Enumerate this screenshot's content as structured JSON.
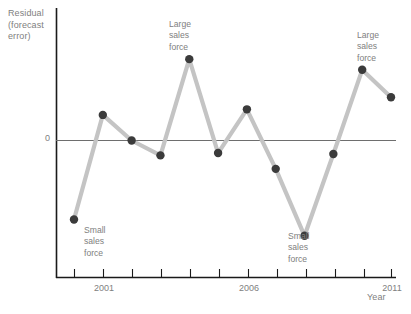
{
  "chart_data": {
    "type": "line",
    "title": "",
    "subtitle": "",
    "xlabel": "Year",
    "ylabel": "Residual\n(forecast\nerror)",
    "ylabel_lines": [
      "Residual",
      "(forecast",
      "error)"
    ],
    "xlim": [
      1999.5,
      2011.5
    ],
    "ylim": [
      -2.3,
      2.1
    ],
    "grid": false,
    "legend": null,
    "zero_line": true,
    "zero_tick_label": "0",
    "x_tick_labels": [
      "2001",
      "2006",
      "2011"
    ],
    "x_tick_label_values": [
      2001,
      2006,
      2011
    ],
    "x_minor_ticks": [
      2000,
      2001,
      2002,
      2003,
      2004,
      2005,
      2006,
      2007,
      2008,
      2009,
      2010,
      2011
    ],
    "x": [
      2000,
      2001,
      2002,
      2003,
      2004,
      2005,
      2006,
      2007,
      2008,
      2009,
      2010,
      2011
    ],
    "values": [
      -1.7,
      0.55,
      0.0,
      -0.32,
      1.75,
      -0.27,
      0.67,
      -0.61,
      -2.05,
      -0.29,
      1.52,
      0.93
    ],
    "series": [
      {
        "name": "Residual (forecast error)",
        "values": [
          -1.7,
          0.55,
          0.0,
          -0.32,
          1.75,
          -0.27,
          0.67,
          -0.61,
          -2.05,
          -0.29,
          1.52,
          0.93
        ],
        "line_color": "#c4c4c4",
        "marker_color": "#3b3b3b"
      }
    ],
    "annotations": [
      {
        "id": "small-1",
        "text": "Small\nsales\nforce",
        "point_index": 0
      },
      {
        "id": "large-1",
        "text": "Large\nsales\nforce",
        "point_index": 4
      },
      {
        "id": "small-2",
        "text": "Small\nsales\nforce",
        "point_index": 8
      },
      {
        "id": "large-2",
        "text": "Large\nsales\nforce",
        "point_index": 10
      }
    ],
    "colors": {
      "line": "#c4c4c4",
      "marker": "#3b3b3b",
      "axis": "#1a1a1a",
      "zero_line": "#6e6e6e",
      "text": "#808080",
      "background": "#ffffff"
    }
  },
  "annotations": {
    "small_1": "Small\nsales\nforce",
    "large_1": "Large\nsales\nforce",
    "small_2": "Small\nsales\nforce",
    "large_2": "Large\nsales\nforce"
  },
  "axes": {
    "y_title": "Residual\n(forecast\nerror)",
    "x_title": "Year",
    "zero_label": "0",
    "x_labels": {
      "first": "2001",
      "second": "2006",
      "third": "2011"
    }
  }
}
